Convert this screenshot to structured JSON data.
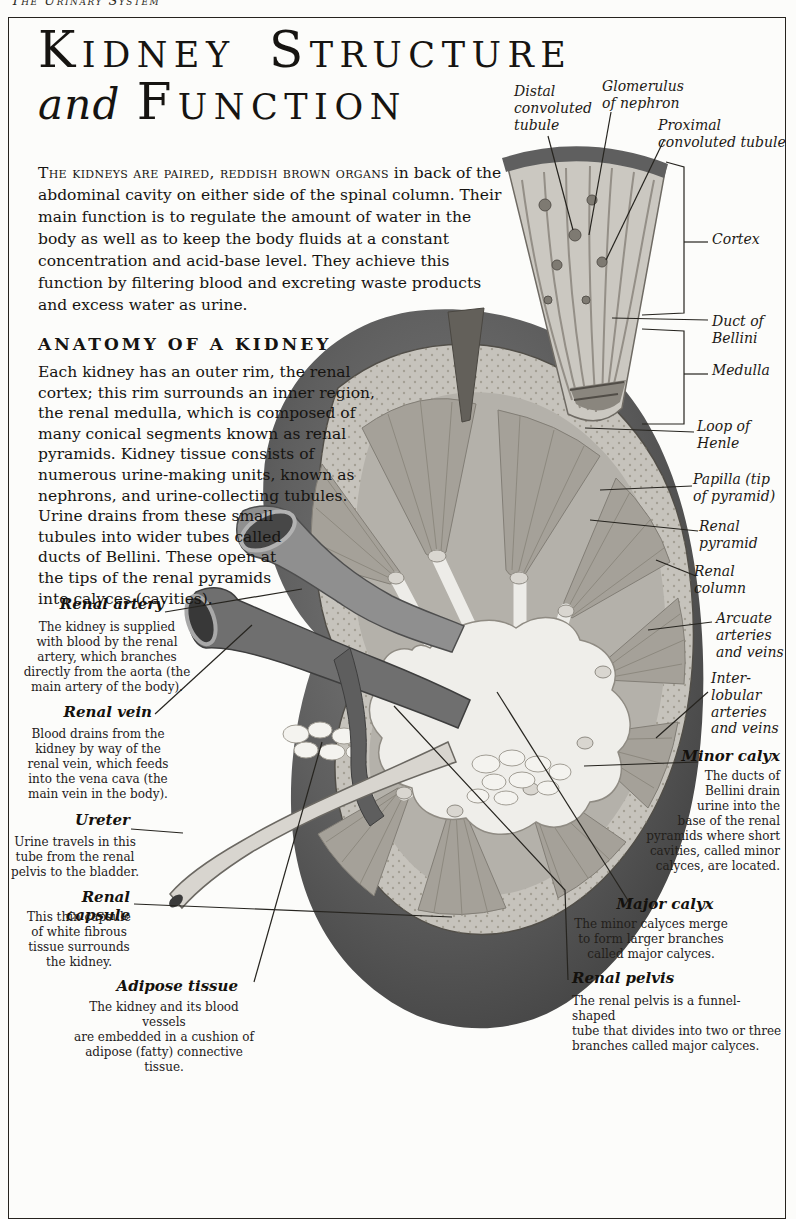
{
  "page": {
    "running_header": "The Urinary System",
    "title": {
      "line1": "Kidney Structure",
      "line2_italic": "and",
      "line2_rest": "Function"
    },
    "intro": {
      "lead": "The kidneys are paired, reddish brown organs",
      "rest": " in back of the abdominal cavity on either side of the spinal column. Their main function is to regulate the amount of water in the body as well as to keep the body fluids at a constant concentration and acid-base level. They achieve this function by filtering blood and excreting waste products and excess water as urine."
    },
    "anatomy_section": {
      "heading": "ANATOMY OF A KIDNEY",
      "body": "Each kidney has an outer rim, the renal cortex; this rim surrounds an inner region, the renal medulla, which is composed of many conical segments known as renal pyramids. Kidney tissue consists of numerous urine-making units, known as nephrons, and urine-collecting tubules. Urine drains from these small tubules into wider tubes called ducts of Bellini. These open at the tips of the renal pyramids into calyces (cavities)."
    }
  },
  "illustration": {
    "annotations": [
      {
        "text": "Distal\nconvoluted\ntubule"
      },
      {
        "text": "Glomerulus\nof nephron"
      },
      {
        "text": "Proximal\nconvoluted tubule"
      },
      {
        "text": "Cortex"
      },
      {
        "text": "Duct of\nBellini"
      },
      {
        "text": "Medulla"
      },
      {
        "text": "Loop of\nHenle"
      },
      {
        "text": "Papilla (tip\nof pyramid)"
      },
      {
        "text": "Renal\npyramid"
      },
      {
        "text": "Renal\ncolumn"
      },
      {
        "text": "Arcuate\narteries\nand veins"
      },
      {
        "text": "Inter-\nlobular\narteries\nand veins"
      }
    ],
    "captioned_left": [
      {
        "name": "Renal artery",
        "description": "The kidney is supplied\nwith blood by the renal\nartery, which branches\ndirectly from the aorta (the\nmain artery of the body)."
      },
      {
        "name": "Renal vein",
        "description": "Blood drains from the\nkidney by way of the\nrenal vein, which feeds\ninto the vena cava (the\nmain vein in the body)."
      },
      {
        "name": "Ureter",
        "description": "Urine travels in this\ntube from the renal\npelvis to the bladder."
      },
      {
        "name": "Renal capsule",
        "description": "This thin capsule\nof white fibrous\ntissue surrounds\nthe kidney."
      },
      {
        "name": "Adipose tissue",
        "description": "The kidney and its blood vessels\nare embedded in a cushion of\nadipose (fatty) connective tissue."
      }
    ],
    "captioned_right": [
      {
        "name": "Minor calyx",
        "description": "The ducts of\nBellini drain\nurine into the\nbase of the renal\npyramids where short\ncavities, called minor\ncalyces, are located."
      },
      {
        "name": "Major calyx",
        "description": "The minor calyces merge\nto form larger branches\ncalled major calyces."
      },
      {
        "name": "Renal pelvis",
        "description": "The renal pelvis is a funnel-shaped\ntube that divides into two or three\nbranches called major calyces."
      }
    ]
  },
  "colors": {
    "page_bg": "#fcfcfa",
    "text": "#161411",
    "capsule_dark": "#4a4a4a",
    "cortex_light": "#c6c3bc",
    "pyramid_gray": "#a5a199",
    "pelvis_white": "#efeeea"
  }
}
